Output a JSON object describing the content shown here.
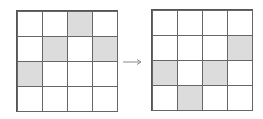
{
  "diagram": {
    "type": "grid-transformation",
    "rows": 4,
    "cols": 4,
    "colors": {
      "filled": "#dcdcdc",
      "empty": "#ffffff",
      "line": "#666666"
    },
    "before": {
      "filled_cells": [
        [
          0,
          2
        ],
        [
          1,
          1
        ],
        [
          1,
          3
        ],
        [
          2,
          0
        ]
      ]
    },
    "after": {
      "filled_cells": [
        [
          1,
          3
        ],
        [
          2,
          0
        ],
        [
          2,
          2
        ],
        [
          3,
          1
        ]
      ]
    },
    "arrow": {
      "icon": "right-arrow-icon"
    }
  }
}
